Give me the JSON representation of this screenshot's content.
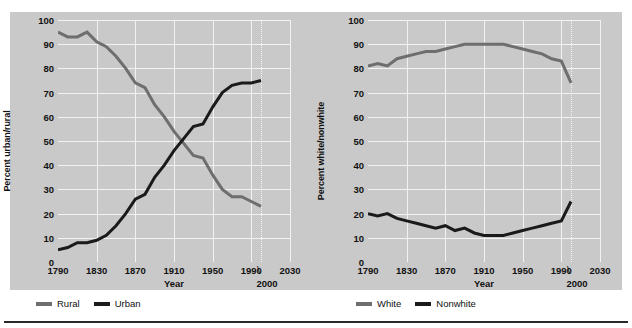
{
  "colors": {
    "panel_bg": "#c9c9c9",
    "grid": "#f2f2f2",
    "gray_series": "#6e6e6e",
    "black_series": "#1a1a1a",
    "text": "#111111",
    "rule": "#2a2a2a"
  },
  "charts": [
    {
      "id": "urban-rural",
      "ylabel": "Percent urban/rural",
      "xlabel": "Year",
      "yticks": [
        "100",
        "90",
        "80",
        "70",
        "60",
        "50",
        "40",
        "30",
        "20",
        "10",
        "0"
      ],
      "xticks": [
        "1790",
        "1830",
        "1870",
        "1910",
        "1950",
        "1990",
        "2030"
      ],
      "x_annotation": "2000",
      "x_annotation_mark": "\\",
      "legend": [
        {
          "label": "Rural",
          "color": "#6e6e6e"
        },
        {
          "label": "Urban",
          "color": "#1a1a1a"
        }
      ],
      "chart_data": {
        "type": "line",
        "title": "",
        "xlabel": "Year",
        "ylabel": "Percent urban/rural",
        "xlim": [
          1790,
          2030
        ],
        "ylim": [
          0,
          100
        ],
        "grid": true,
        "legend_position": "below",
        "x": [
          1790,
          1800,
          1810,
          1820,
          1830,
          1840,
          1850,
          1860,
          1870,
          1880,
          1890,
          1900,
          1910,
          1920,
          1930,
          1940,
          1950,
          1960,
          1970,
          1980,
          1990,
          2000
        ],
        "series": [
          {
            "name": "Rural",
            "color": "#6e6e6e",
            "values": [
              95,
              93,
              93,
              95,
              91,
              89,
              85,
              80,
              74,
              72,
              65,
              60,
              54,
              49,
              44,
              43,
              36,
              30,
              27,
              27,
              25,
              23,
              26
            ]
          },
          {
            "name": "Urban",
            "color": "#1a1a1a",
            "values": [
              5,
              6,
              8,
              8,
              9,
              11,
              15,
              20,
              26,
              28,
              35,
              40,
              46,
              51,
              56,
              57,
              64,
              70,
              73,
              74,
              74,
              75,
              75
            ]
          }
        ]
      }
    },
    {
      "id": "white-nonwhite",
      "ylabel": "Percent white/nonwhite",
      "xlabel": "Year",
      "yticks": [
        "100",
        "90",
        "80",
        "70",
        "60",
        "50",
        "40",
        "30",
        "20",
        "10",
        "0"
      ],
      "xticks": [
        "1790",
        "1830",
        "1870",
        "1910",
        "1950",
        "1990",
        "2030"
      ],
      "x_annotation": "2000",
      "x_annotation_mark": "\\",
      "legend": [
        {
          "label": "White",
          "color": "#6e6e6e"
        },
        {
          "label": "Nonwhite",
          "color": "#1a1a1a"
        }
      ],
      "chart_data": {
        "type": "line",
        "title": "",
        "xlabel": "Year",
        "ylabel": "Percent white/nonwhite",
        "xlim": [
          1790,
          2030
        ],
        "ylim": [
          0,
          100
        ],
        "grid": true,
        "legend_position": "below",
        "x": [
          1790,
          1800,
          1810,
          1820,
          1830,
          1840,
          1850,
          1860,
          1870,
          1880,
          1890,
          1900,
          1910,
          1920,
          1930,
          1940,
          1950,
          1960,
          1970,
          1980,
          1990,
          2000
        ],
        "series": [
          {
            "name": "White",
            "color": "#6e6e6e",
            "values": [
              81,
              82,
              81,
              84,
              85,
              86,
              87,
              87,
              88,
              89,
              90,
              90,
              90,
              90,
              90,
              89,
              88,
              87,
              86,
              84,
              83,
              74
            ]
          },
          {
            "name": "Nonwhite",
            "color": "#1a1a1a",
            "values": [
              20,
              19,
              20,
              18,
              17,
              16,
              15,
              14,
              15,
              13,
              14,
              12,
              11,
              11,
              11,
              12,
              13,
              14,
              15,
              16,
              17,
              25
            ]
          }
        ]
      }
    }
  ]
}
